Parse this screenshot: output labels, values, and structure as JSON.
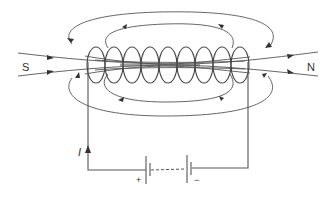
{
  "diagram": {
    "labels": {
      "south": "S",
      "north": "N",
      "current": "I",
      "positive": "+",
      "negative": "−"
    },
    "colors": {
      "lines": "#555555",
      "text": "#333333",
      "background": "#ffffff"
    },
    "coil_turns": 9
  }
}
